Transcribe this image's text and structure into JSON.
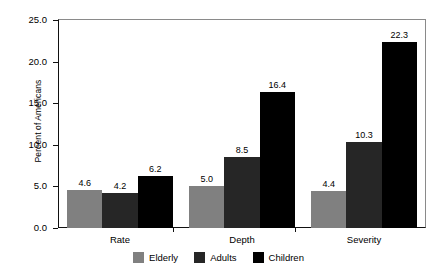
{
  "chart_data": {
    "type": "bar",
    "title": "",
    "subtitle": "",
    "xlabel": "",
    "ylabel": "Percent of Americans",
    "categories": [
      "Rate",
      "Depth",
      "Severity"
    ],
    "series": [
      {
        "name": "Elderly",
        "color": "#808080",
        "values": [
          4.6,
          5.0,
          4.4
        ]
      },
      {
        "name": "Adults",
        "color": "#262626",
        "values": [
          4.2,
          8.5,
          10.3
        ]
      },
      {
        "name": "Children",
        "color": "#000000",
        "values": [
          6.2,
          16.4,
          22.3
        ]
      }
    ],
    "ylim": [
      0.0,
      25.0
    ],
    "y_ticks": [
      "0.0",
      "5.0",
      "10.0",
      "15.0",
      "20.0",
      "25.0"
    ],
    "y_tick_values": [
      0.0,
      5.0,
      10.0,
      15.0,
      20.0,
      25.0
    ],
    "grid": false,
    "legend_position": "bottom",
    "data_labels": [
      [
        "4.6",
        "4.2",
        "6.2"
      ],
      [
        "5.0",
        "8.5",
        "16.4"
      ],
      [
        "4.4",
        "10.3",
        "22.3"
      ]
    ]
  },
  "axes": {
    "y_title": "Percent of Americans"
  },
  "legend": {
    "items": [
      {
        "label": "Elderly",
        "color": "#808080"
      },
      {
        "label": "Adults",
        "color": "#262626"
      },
      {
        "label": "Children",
        "color": "#000000"
      }
    ]
  }
}
